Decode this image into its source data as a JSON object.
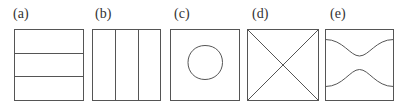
{
  "figure": {
    "stroke_color": "#555555",
    "panels": [
      {
        "label": "(a)",
        "pattern": "three-horizontal-strips"
      },
      {
        "label": "(b)",
        "pattern": "three-vertical-strips"
      },
      {
        "label": "(c)",
        "pattern": "circle-in-square"
      },
      {
        "label": "(d)",
        "pattern": "diagonal-cross"
      },
      {
        "label": "(e)",
        "pattern": "two-waist-curves"
      }
    ]
  }
}
